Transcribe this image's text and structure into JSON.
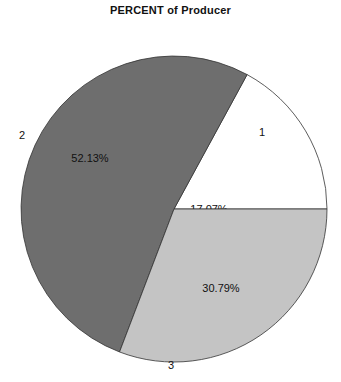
{
  "chart_data": {
    "type": "pie",
    "title": "PERCENT of Producer",
    "categories": [
      "1",
      "2",
      "3"
    ],
    "values": [
      17.07,
      52.13,
      30.79
    ],
    "value_labels": [
      "17.07%",
      "52.13%",
      "30.79%"
    ],
    "colors": [
      "#ffffff",
      "#6e6e6e",
      "#c4c4c4"
    ],
    "start_angle_deg": 0,
    "direction": "counterclockwise",
    "legend": "none",
    "xlabel": "",
    "ylabel": ""
  },
  "layout": {
    "cx": 174,
    "cy": 209,
    "r": 153
  }
}
